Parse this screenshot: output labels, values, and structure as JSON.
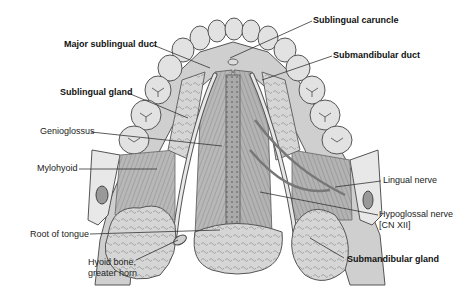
{
  "figure": {
    "labels": [
      {
        "id": "sublingual-caruncle",
        "text": "Sublingual caruncle",
        "bold": true,
        "x": 313,
        "y": 15,
        "line": [
          [
            312,
            21
          ],
          [
            230,
            58
          ]
        ]
      },
      {
        "id": "major-sublingual-duct",
        "text": "Major sublingual duct",
        "bold": true,
        "x": 64,
        "y": 39,
        "line": [
          [
            153,
            45
          ],
          [
            210,
            68
          ]
        ]
      },
      {
        "id": "submandibular-duct",
        "text": "Submandibular duct",
        "bold": true,
        "x": 333,
        "y": 50,
        "line": [
          [
            332,
            56
          ],
          [
            262,
            80
          ]
        ]
      },
      {
        "id": "sublingual-gland",
        "text": "Sublingual gland",
        "bold": true,
        "x": 60,
        "y": 87,
        "line": [
          [
            128,
            93
          ],
          [
            188,
            118
          ]
        ]
      },
      {
        "id": "genioglossus",
        "text": "Genioglossus",
        "bold": false,
        "x": 40,
        "y": 126,
        "line": [
          [
            91,
            132
          ],
          [
            222,
            146
          ]
        ]
      },
      {
        "id": "mylohyoid",
        "text": "Mylohyoid",
        "bold": false,
        "x": 37,
        "y": 163,
        "line": [
          [
            79,
            169
          ],
          [
            157,
            169
          ]
        ]
      },
      {
        "id": "lingual-nerve",
        "text": "Lingual nerve",
        "bold": false,
        "x": 383,
        "y": 175,
        "line": [
          [
            381,
            181
          ],
          [
            335,
            187
          ]
        ]
      },
      {
        "id": "hypoglossal-nerve",
        "text": "Hypoglossal nerve",
        "text2": "[CN XII]",
        "bold": false,
        "x": 379,
        "y": 210,
        "line": [
          [
            378,
            215
          ],
          [
            260,
            192
          ]
        ]
      },
      {
        "id": "root-of-tongue",
        "text": "Root of tongue",
        "bold": false,
        "x": 30,
        "y": 229,
        "line": [
          [
            90,
            234
          ],
          [
            220,
            230
          ]
        ]
      },
      {
        "id": "hyoid-bone",
        "text": "Hyoid bone,",
        "text2": "greater horn",
        "bold": false,
        "x": 88,
        "y": 257,
        "line": [
          [
            136,
            260
          ],
          [
            178,
            240
          ]
        ]
      },
      {
        "id": "submandibular-gland",
        "text": "Submandibular gland",
        "bold": true,
        "x": 347,
        "y": 254,
        "line": [
          [
            344,
            258
          ],
          [
            310,
            238
          ]
        ]
      }
    ]
  },
  "colors": {
    "background": "#ffffff",
    "label_text": "#222222",
    "leader_line": "#333333",
    "tissue_light": "#e4e4e4",
    "tissue_mid": "#bdbdbd",
    "tissue_dark": "#7a7a7a",
    "outline": "#4a4a4a"
  }
}
